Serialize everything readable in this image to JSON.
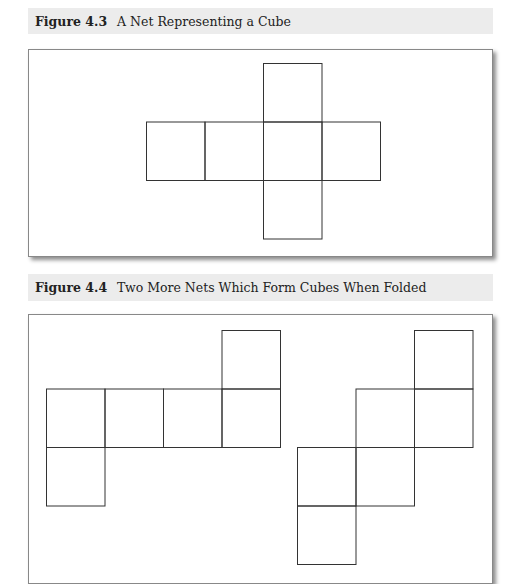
{
  "figures": [
    {
      "number": "Figure 4.3",
      "title": "A Net Representing a Cube",
      "nets": [
        {
          "squares": [
            [
              2,
              0
            ],
            [
              0,
              1
            ],
            [
              1,
              1
            ],
            [
              2,
              1
            ],
            [
              3,
              1
            ],
            [
              2,
              2
            ]
          ],
          "origin": [
            146,
            63
          ]
        }
      ]
    },
    {
      "number": "Figure 4.4",
      "title": "Two More Nets Which Form Cubes When Folded",
      "nets": [
        {
          "squares": [
            [
              3,
              0
            ],
            [
              0,
              1
            ],
            [
              1,
              1
            ],
            [
              2,
              1
            ],
            [
              3,
              1
            ],
            [
              0,
              2
            ]
          ],
          "origin": [
            46,
            330
          ]
        },
        {
          "squares": [
            [
              2,
              0
            ],
            [
              1,
              1
            ],
            [
              2,
              1
            ],
            [
              0,
              2
            ],
            [
              1,
              2
            ],
            [
              0,
              3
            ]
          ],
          "origin": [
            297,
            330
          ]
        }
      ]
    }
  ],
  "square_size": 58.5
}
